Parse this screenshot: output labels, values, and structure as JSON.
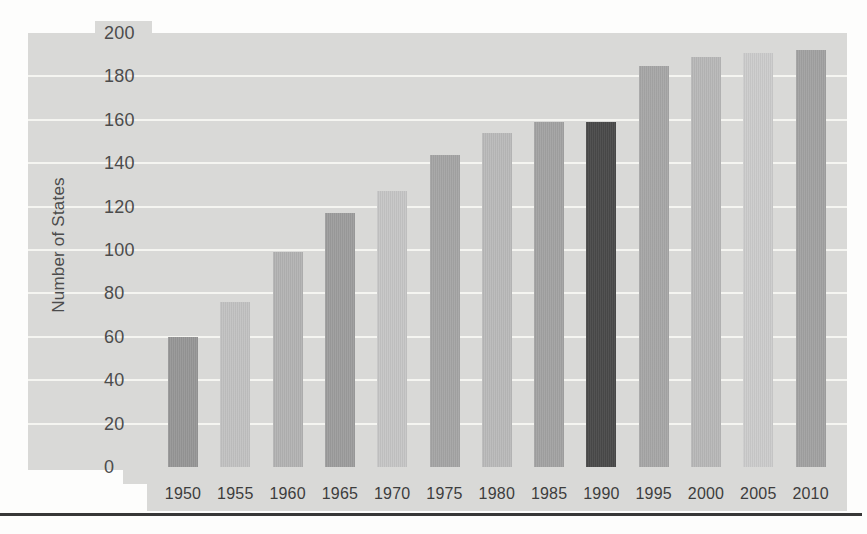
{
  "page": {
    "background_color": "#fdfdfc",
    "divider_rule_color": "#262626"
  },
  "chart_data": {
    "type": "bar",
    "title": "",
    "xlabel": "",
    "ylabel": "Number of States",
    "categories": [
      "1950",
      "1955",
      "1960",
      "1965",
      "1970",
      "1975",
      "1980",
      "1985",
      "1990",
      "1995",
      "2000",
      "2005",
      "2010"
    ],
    "values": [
      60,
      76,
      99,
      117,
      127,
      144,
      154,
      159,
      159,
      185,
      189,
      191,
      192
    ],
    "ylim": [
      0,
      200
    ],
    "yticks": [
      0,
      20,
      40,
      60,
      80,
      100,
      120,
      140,
      160,
      180,
      200
    ],
    "grid": "horizontal",
    "gridline_color": "#f6f6f3",
    "legend": "none",
    "plot_background": "#d9d9d7",
    "axis_text_color": "#4c4c4c",
    "bar_colors": [
      "#979797",
      "#c2c2c2",
      "#b3b3b3",
      "#9d9d9d",
      "#c6c6c6",
      "#a5a5a5",
      "#bababa",
      "#a3a3a3",
      "#4a4a4a",
      "#a7a7a7",
      "#b8b8b8",
      "#cccccc",
      "#a2a2a2"
    ],
    "highlighted_category": "1990",
    "highlight_color": "#4a4a4a"
  }
}
